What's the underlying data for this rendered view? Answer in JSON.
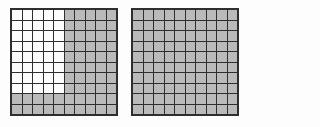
{
  "figure": {
    "colors": {
      "background": "#fdfdfd",
      "shaded_fill": "#bababa",
      "unshaded_fill": "#fcfcfc",
      "grid_line": "#2e2e2e"
    },
    "grids": [
      {
        "name": "left-hundred-grid",
        "rows": 10,
        "cols": 10,
        "total_cells": 100,
        "shaded_count": 60,
        "unshaded_count": 40,
        "shaded_value": "0.60",
        "row_patterns": [
          "0000011111",
          "0000011111",
          "0000011111",
          "0000011111",
          "0000011111",
          "0000011111",
          "0000011111",
          "0000011111",
          "1111111111",
          "1111111111"
        ]
      },
      {
        "name": "right-hundred-grid",
        "rows": 10,
        "cols": 10,
        "total_cells": 100,
        "shaded_count": 100,
        "unshaded_count": 0,
        "shaded_value": "1.00",
        "row_patterns": [
          "1111111111",
          "1111111111",
          "1111111111",
          "1111111111",
          "1111111111",
          "1111111111",
          "1111111111",
          "1111111111",
          "1111111111",
          "1111111111"
        ]
      }
    ]
  }
}
